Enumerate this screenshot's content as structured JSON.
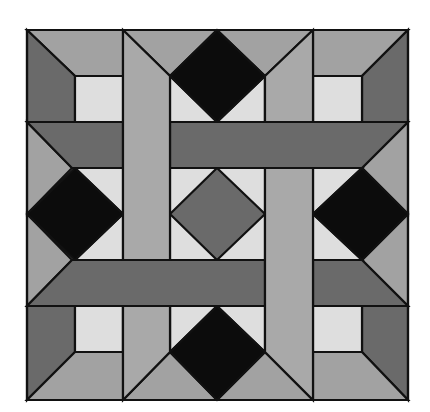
{
  "diagram": {
    "type": "quilt-block",
    "palette": {
      "black": "#0c0c0c",
      "dark": "#6a6a6a",
      "medium": "#a2a2a2",
      "strip": "#a9a9a9",
      "light": "#dedede",
      "outline": "#111111"
    }
  }
}
